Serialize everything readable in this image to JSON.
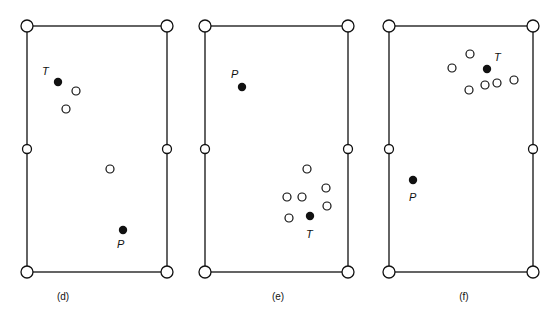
{
  "panels": [
    {
      "caption": "(d)",
      "table": {
        "x1": 27,
        "y1": 26,
        "x2": 167,
        "y2": 272
      },
      "target": {
        "label": "T",
        "x": 58,
        "y": 82,
        "lx": 42,
        "ly": 75
      },
      "player": {
        "label": "P",
        "x": 123,
        "y": 230,
        "lx": 117,
        "ly": 248
      },
      "obstacles": [
        [
          76,
          91
        ],
        [
          66,
          109
        ],
        [
          110,
          169
        ]
      ],
      "caption_pos": [
        63,
        300
      ]
    },
    {
      "caption": "(e)",
      "table": {
        "x1": 205,
        "y1": 26,
        "x2": 348,
        "y2": 272
      },
      "target": {
        "label": "T",
        "x": 310,
        "y": 216,
        "lx": 306,
        "ly": 238
      },
      "player": {
        "label": "P",
        "x": 242,
        "y": 87,
        "lx": 231,
        "ly": 78
      },
      "obstacles": [
        [
          307,
          169
        ],
        [
          326,
          188
        ],
        [
          287,
          197
        ],
        [
          302,
          197
        ],
        [
          327,
          206
        ],
        [
          289,
          218
        ]
      ],
      "caption_pos": [
        278,
        300
      ]
    },
    {
      "caption": "(f)",
      "table": {
        "x1": 389,
        "y1": 26,
        "x2": 533,
        "y2": 272
      },
      "target": {
        "label": "T",
        "x": 487,
        "y": 69,
        "lx": 494,
        "ly": 61
      },
      "player": {
        "label": "P",
        "x": 413,
        "y": 180,
        "lx": 409,
        "ly": 201
      },
      "obstacles": [
        [
          470,
          54
        ],
        [
          452,
          68
        ],
        [
          514,
          80
        ],
        [
          497,
          83
        ],
        [
          485,
          85
        ],
        [
          469,
          90
        ]
      ],
      "caption_pos": [
        464,
        300
      ]
    }
  ]
}
